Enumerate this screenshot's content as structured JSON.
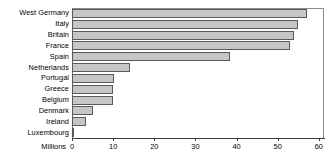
{
  "chart_data": {
    "type": "bar",
    "orientation": "horizontal",
    "title": "",
    "xlabel": "Millions",
    "ylabel": "",
    "categories": [
      "West Germany",
      "Italy",
      "Britain",
      "France",
      "Spain",
      "Netherlands",
      "Portugal",
      "Greece",
      "Belgium",
      "Denmark",
      "Ireland",
      "Luxembourg"
    ],
    "values": [
      57,
      55,
      54,
      53,
      38.5,
      14,
      10.2,
      10,
      9.9,
      5.1,
      3.5,
      0.4
    ],
    "xlim": [
      0,
      61
    ],
    "xticks": [
      0,
      10,
      20,
      30,
      40,
      50,
      60
    ],
    "xticklabels": [
      "0",
      "10",
      "20",
      "30",
      "40",
      "50",
      "60"
    ],
    "grid": false,
    "legend": null,
    "bar_fill_color": "#c6c6c6",
    "bar_edge_color": "#5a5a5a",
    "axis_color": "#3c3c3c",
    "background_color": "#ffffff"
  }
}
